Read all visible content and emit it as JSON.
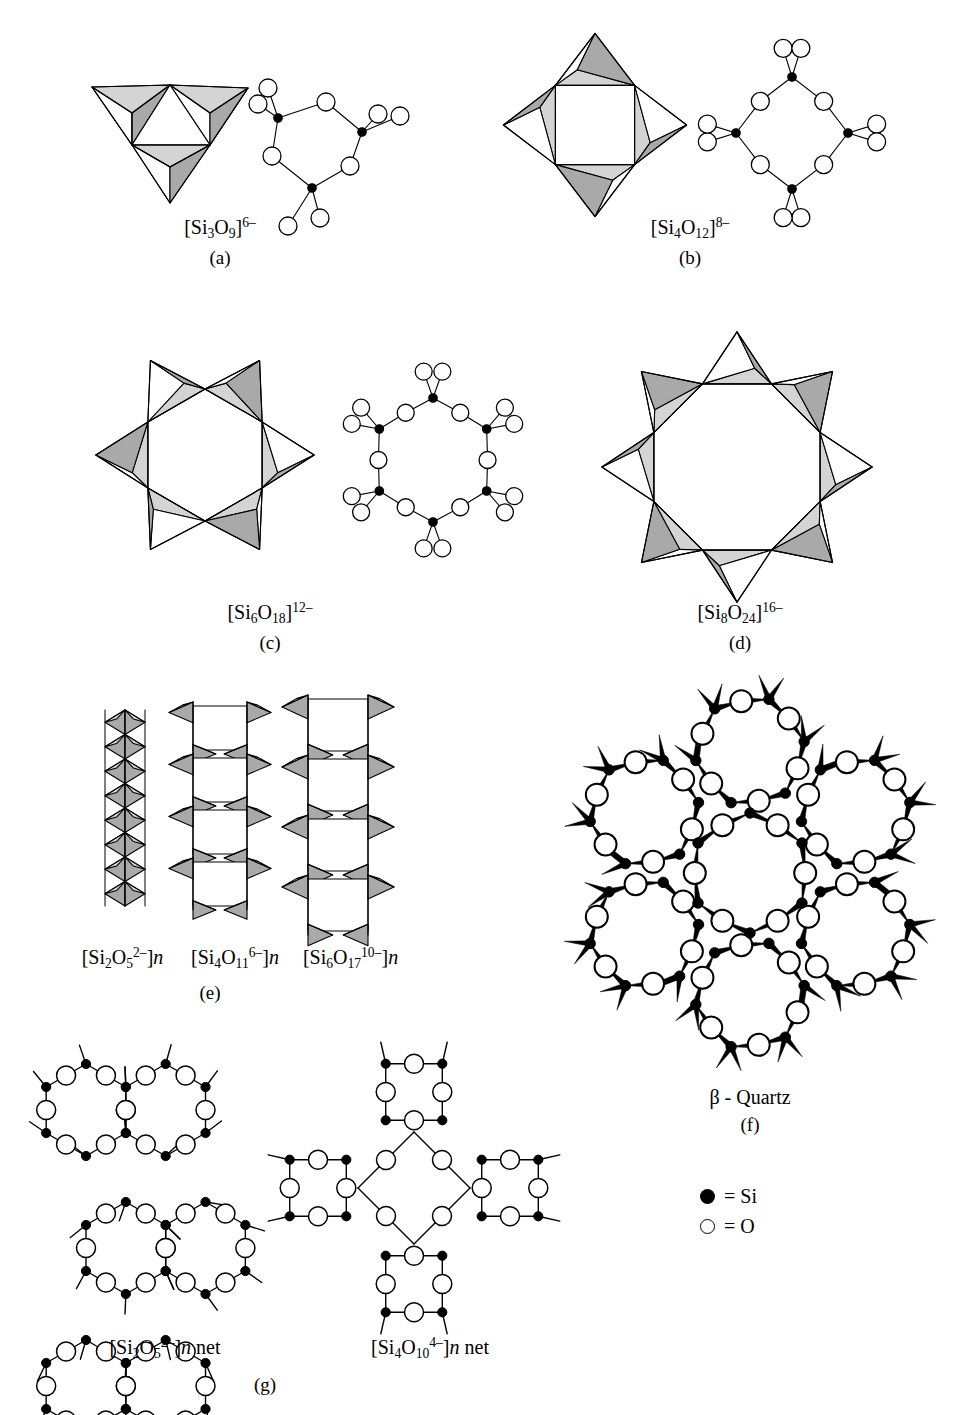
{
  "figure": {
    "legend": {
      "si_symbol": "●",
      "si_label": "= Si",
      "o_symbol": "○",
      "o_label": "= O"
    },
    "colors": {
      "stroke": "#000000",
      "face_light": "#d4d4d4",
      "face_mid": "#a9a9a9",
      "face_white": "#ffffff",
      "si_fill": "#000000",
      "o_fill": "#ffffff",
      "background": "#ffffff"
    }
  },
  "panels": [
    {
      "id": "a",
      "letter": "(a)",
      "formula_html": "[Si<sub>3</sub>O<sub>9</sub>]<sup>6–</sup>",
      "formula_text": "[Si3O9]6-",
      "n_tetrahedra": 3,
      "ring_size": 3,
      "description": "cyclic trisilicate, three corner-sharing tetrahedra"
    },
    {
      "id": "b",
      "letter": "(b)",
      "formula_html": "[Si<sub>4</sub>O<sub>12</sub>]<sup>8–</sup>",
      "formula_text": "[Si4O12]8-",
      "n_tetrahedra": 4,
      "ring_size": 4,
      "description": "cyclic tetrasilicate, four corner-sharing tetrahedra"
    },
    {
      "id": "c",
      "letter": "(c)",
      "formula_html": "[Si<sub>6</sub>O<sub>18</sub>]<sup>12–</sup>",
      "formula_text": "[Si6O18]12-",
      "n_tetrahedra": 6,
      "ring_size": 6,
      "description": "cyclic hexasilicate, six corner-sharing tetrahedra"
    },
    {
      "id": "d",
      "letter": "(d)",
      "formula_html": "[Si<sub>8</sub>O<sub>24</sub>]<sup>16–</sup>",
      "formula_text": "[Si8O24]16-",
      "n_tetrahedra": 8,
      "ring_size": 8,
      "description": "cyclic octasilicate, eight corner-sharing tetrahedra"
    },
    {
      "id": "e",
      "letter": "(e)",
      "description": "infinite chain and ribbon silicates",
      "chains": [
        {
          "formula_html": "[Si<sub>2</sub>O<sub>5</sub><sup>2–</sup>]<span class=\"ital\">n</span>",
          "formula_text": "[Si2O5 2-]n",
          "width_units": 1
        },
        {
          "formula_html": "[Si<sub>4</sub>O<sub>11</sub><sup>6–</sup>]<span class=\"ital\">n</span>",
          "formula_text": "[Si4O11 6-]n",
          "width_units": 2
        },
        {
          "formula_html": "[Si<sub>6</sub>O<sub>17</sub><sup>10–</sup>]<span class=\"ital\">n</span>",
          "formula_text": "[Si6O17 10-]n",
          "width_units": 3
        }
      ]
    },
    {
      "id": "f",
      "letter": "(f)",
      "title": "β - Quartz",
      "description": "three-dimensional framework, ball-and-stick projection"
    },
    {
      "id": "g",
      "letter": "(g)",
      "description": "two-dimensional sheet silicate nets",
      "nets": [
        {
          "formula_html": "[Si<sub>2</sub>O<sub>5</sub><sup>2–</sup>]<span class=\"ital\">n</span> net",
          "formula_text": "[Si2O5 2-]n net",
          "ring_type": "hexagonal 6-ring"
        },
        {
          "formula_html": "[Si<sub>4</sub>O<sub>10</sub><sup>4–</sup>]<span class=\"ital\">n</span> net",
          "formula_text": "[Si4O10 4-]n net",
          "ring_type": "square 4-ring"
        }
      ]
    }
  ]
}
